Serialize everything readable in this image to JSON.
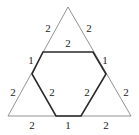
{
  "diagram": {
    "outer_triangle_labels": {
      "top_left_upper": "2",
      "top_right_upper": "2",
      "left_lower": "2",
      "right_lower": "2",
      "bottom_left": "2",
      "bottom_right": "2"
    },
    "hexagon_labels": {
      "top": "2",
      "upper_left": "1",
      "upper_right": "1",
      "lower_left": "2",
      "lower_right": "2",
      "bottom": "1"
    },
    "colors": {
      "outer_stroke": "#777777",
      "hexagon_stroke": "#2a2a2a",
      "text": "#222222"
    }
  }
}
